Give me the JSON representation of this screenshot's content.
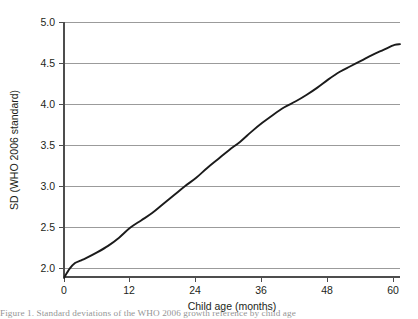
{
  "chart_data": {
    "type": "line",
    "title": "",
    "subtitle": "",
    "xlabel": "Child age (months)",
    "ylabel": "SD (WHO 2006 standard)",
    "xlim": [
      0,
      61
    ],
    "ylim": [
      1.78,
      5.0
    ],
    "xticks": [
      0,
      12,
      24,
      36,
      48,
      60
    ],
    "xticklabels": [
      "0",
      "12",
      "24",
      "36",
      "48",
      "60"
    ],
    "yticks": [
      2.0,
      2.5,
      3.0,
      3.5,
      4.0,
      4.5,
      5.0
    ],
    "yticklabels": [
      "2.0",
      "2.5",
      "3.0",
      "3.5",
      "4.0",
      "4.5",
      "5.0"
    ],
    "grid": "horizontal",
    "legend": null,
    "annotations": [],
    "line_color": "#1b1b1b",
    "grid_color": "#9b9b9b",
    "axis_color": "#4d4d4d",
    "series": [
      {
        "name": "SD (WHO 2006 standard)",
        "x": [
          0,
          1,
          2,
          3,
          4,
          6,
          8,
          10,
          12,
          14,
          16,
          18,
          20,
          22,
          24,
          26,
          28,
          30,
          32,
          34,
          36,
          38,
          40,
          42,
          44,
          46,
          48,
          50,
          52,
          54,
          56,
          58,
          60,
          61
        ],
        "values": [
          1.88,
          1.99,
          2.06,
          2.09,
          2.12,
          2.19,
          2.27,
          2.37,
          2.49,
          2.58,
          2.67,
          2.78,
          2.89,
          3.0,
          3.1,
          3.22,
          3.33,
          3.44,
          3.54,
          3.66,
          3.77,
          3.87,
          3.96,
          4.03,
          4.11,
          4.2,
          4.3,
          4.39,
          4.46,
          4.53,
          4.6,
          4.66,
          4.72,
          4.73
        ]
      }
    ]
  },
  "axes": {
    "x_title": "Child age (months)",
    "y_title": "SD (WHO 2006 standard)"
  },
  "caption": {
    "text": "Figure 1. Standard deviations of the WHO 2006 growth reference by child age"
  }
}
